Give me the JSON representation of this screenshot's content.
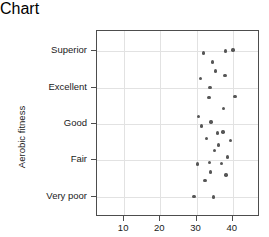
{
  "chart_data": {
    "type": "scatter",
    "title": "",
    "xlabel": "Midarm muscle circumference (cm)",
    "ylabel": "Aerobic fitness",
    "xlim": [
      2.5,
      47.5
    ],
    "xticks": [
      10,
      20,
      30,
      40
    ],
    "xtick_labels": [
      "10",
      "20",
      "30",
      "40"
    ],
    "categories": [
      "Very poor",
      "Fair",
      "Good",
      "Excellent",
      "Superior"
    ],
    "ytick_labels_top_to_bottom": [
      "Superior",
      "Excellent",
      "Good",
      "Fair",
      "Very poor"
    ],
    "ylim": [
      0.45,
      5.55
    ],
    "grid": true,
    "legend": null,
    "point_color": "#565656",
    "frame_color": "#4d4d4d",
    "grid_color": "#e2e2e2",
    "n_points": 29,
    "points": [
      {
        "x": 31.9,
        "y": 4.95,
        "category": "Superior"
      },
      {
        "x": 38.0,
        "y": 5.0,
        "category": "Superior"
      },
      {
        "x": 40.0,
        "y": 5.03,
        "category": "Superior"
      },
      {
        "x": 34.4,
        "y": 4.7,
        "category": "Superior"
      },
      {
        "x": 31.1,
        "y": 4.25,
        "category": "Excellent"
      },
      {
        "x": 37.8,
        "y": 4.33,
        "category": "Excellent"
      },
      {
        "x": 33.7,
        "y": 4.0,
        "category": "Excellent"
      },
      {
        "x": 33.4,
        "y": 3.72,
        "category": "Excellent"
      },
      {
        "x": 40.6,
        "y": 3.75,
        "category": "Excellent"
      },
      {
        "x": 37.4,
        "y": 3.42,
        "category": "Good"
      },
      {
        "x": 30.6,
        "y": 3.2,
        "category": "Good"
      },
      {
        "x": 34.0,
        "y": 3.05,
        "category": "Good"
      },
      {
        "x": 37.3,
        "y": 2.78,
        "category": "Good"
      },
      {
        "x": 35.8,
        "y": 2.75,
        "category": "Good"
      },
      {
        "x": 32.7,
        "y": 2.6,
        "category": "Good"
      },
      {
        "x": 39.4,
        "y": 2.55,
        "category": "Good"
      },
      {
        "x": 35.0,
        "y": 2.28,
        "category": "Fair"
      },
      {
        "x": 38.5,
        "y": 2.1,
        "category": "Fair"
      },
      {
        "x": 33.6,
        "y": 1.95,
        "category": "Fair"
      },
      {
        "x": 30.2,
        "y": 1.9,
        "category": "Fair"
      },
      {
        "x": 36.8,
        "y": 1.92,
        "category": "Fair"
      },
      {
        "x": 33.9,
        "y": 1.68,
        "category": "Very poor"
      },
      {
        "x": 38.1,
        "y": 1.6,
        "category": "Very poor"
      },
      {
        "x": 32.3,
        "y": 1.45,
        "category": "Very poor"
      },
      {
        "x": 29.3,
        "y": 1.02,
        "category": "Very poor"
      },
      {
        "x": 34.6,
        "y": 1.0,
        "category": "Very poor"
      },
      {
        "x": 36.0,
        "y": 2.42,
        "category": "Fair"
      },
      {
        "x": 31.3,
        "y": 2.95,
        "category": "Good"
      },
      {
        "x": 35.2,
        "y": 4.45,
        "category": "Superior"
      }
    ]
  }
}
